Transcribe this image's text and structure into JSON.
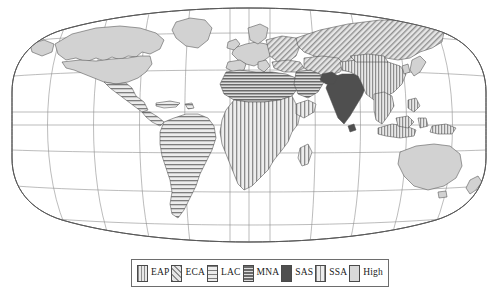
{
  "figure": {
    "kind": "choropleth-world-map",
    "projection": "robinson",
    "background_color": "#ffffff",
    "graticule_color": "#8a8a8a",
    "coastline_color": "#555555"
  },
  "legend": {
    "border_color": "#6d6d6d",
    "entries": [
      {
        "code": "EAP",
        "label": "EAP",
        "pattern": "vertical-lines",
        "fill": "#b9b9b9",
        "stroke": "#4a4a4a"
      },
      {
        "code": "ECA",
        "label": "ECA",
        "pattern": "diagonal-lines",
        "fill": "#c2c2c2",
        "stroke": "#4a4a4a"
      },
      {
        "code": "LAC",
        "label": "LAC",
        "pattern": "horizontal-lines-wide",
        "fill": "#d5d5d5",
        "stroke": "#4a4a4a"
      },
      {
        "code": "MNA",
        "label": "MNA",
        "pattern": "horizontal-lines-dense",
        "fill": "#9f9f9f",
        "stroke": "#4a4a4a"
      },
      {
        "code": "SAS",
        "label": "SAS",
        "pattern": "solid-dark",
        "fill": "#4f4f4f",
        "stroke": "#3a3a3a"
      },
      {
        "code": "SSA",
        "label": "SSA",
        "pattern": "vertical-lines-wide",
        "fill": "#cacaca",
        "stroke": "#4a4a4a"
      },
      {
        "code": "High",
        "label": "High",
        "pattern": "solid-light",
        "fill": "#d9d9d9",
        "stroke": "#4a4a4a"
      }
    ]
  },
  "map_regions": [
    {
      "name": "canada",
      "group": "High"
    },
    {
      "name": "united-states",
      "group": "High"
    },
    {
      "name": "greenland",
      "group": "High"
    },
    {
      "name": "mexico",
      "group": "LAC"
    },
    {
      "name": "central-america",
      "group": "LAC"
    },
    {
      "name": "caribbean",
      "group": "LAC"
    },
    {
      "name": "south-america",
      "group": "LAC"
    },
    {
      "name": "western-europe",
      "group": "High"
    },
    {
      "name": "eastern-europe",
      "group": "ECA"
    },
    {
      "name": "russia",
      "group": "ECA"
    },
    {
      "name": "central-asia",
      "group": "ECA"
    },
    {
      "name": "turkey",
      "group": "ECA"
    },
    {
      "name": "north-africa",
      "group": "MNA"
    },
    {
      "name": "middle-east",
      "group": "MNA"
    },
    {
      "name": "sub-saharan-africa",
      "group": "SSA"
    },
    {
      "name": "madagascar",
      "group": "SSA"
    },
    {
      "name": "india",
      "group": "SAS"
    },
    {
      "name": "pakistan",
      "group": "SAS"
    },
    {
      "name": "bangladesh",
      "group": "SAS"
    },
    {
      "name": "sri-lanka",
      "group": "SAS"
    },
    {
      "name": "china",
      "group": "EAP"
    },
    {
      "name": "mongolia",
      "group": "EAP"
    },
    {
      "name": "southeast-asia",
      "group": "EAP"
    },
    {
      "name": "indonesia",
      "group": "EAP"
    },
    {
      "name": "philippines",
      "group": "EAP"
    },
    {
      "name": "papua-new-guinea",
      "group": "EAP"
    },
    {
      "name": "japan",
      "group": "High"
    },
    {
      "name": "south-korea",
      "group": "High"
    },
    {
      "name": "australia",
      "group": "High"
    },
    {
      "name": "new-zealand",
      "group": "High"
    }
  ]
}
